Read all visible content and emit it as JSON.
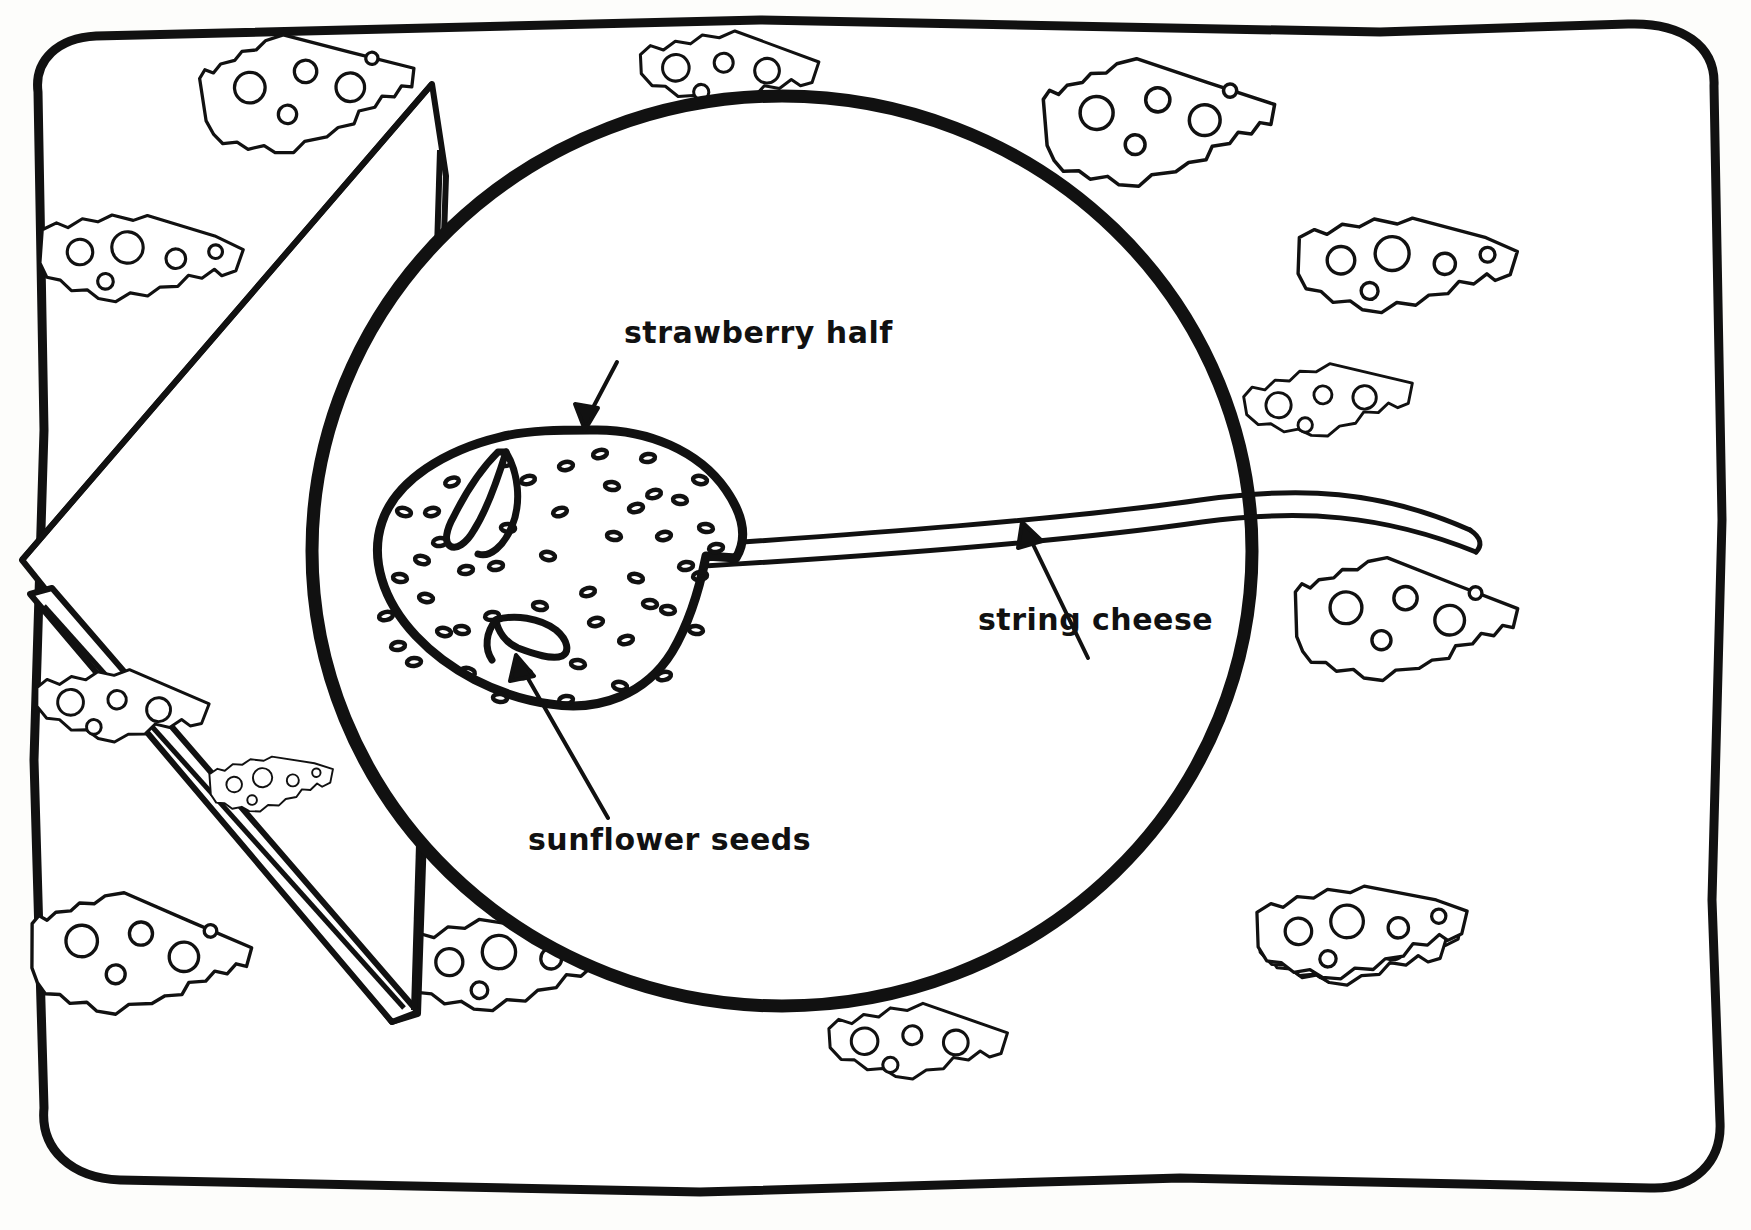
{
  "document": {
    "title": "Strawberry Mouse Snack",
    "style": "black-and-white hand-drawn line illustration",
    "background_color": "#fdfdfb",
    "ink_color": "#111111"
  },
  "labels": [
    {
      "id": "strawberry-half",
      "text": "strawberry half",
      "x": 624,
      "y": 318,
      "arrow": {
        "from_x": 617,
        "from_y": 362,
        "to_x": 585,
        "to_y": 430
      }
    },
    {
      "id": "string-cheese",
      "text": "string cheese",
      "x": 978,
      "y": 605,
      "arrow": {
        "from_x": 1090,
        "from_y": 660,
        "to_x": 1022,
        "to_y": 522
      }
    },
    {
      "id": "sunflower-seeds",
      "text": "sunflower seeds",
      "x": 528,
      "y": 825,
      "arrow": {
        "from_x": 608,
        "from_y": 818,
        "to_x": 516,
        "to_y": 655
      }
    }
  ],
  "scene": {
    "placemat": {
      "name": "cheese-print placemat",
      "outline": "hand-drawn rounded rectangle",
      "stroke_width": 9
    },
    "plate": {
      "name": "round plate",
      "center_x": 782,
      "center_y": 551,
      "radius_x": 470,
      "radius_y": 455,
      "stroke_width": 13
    },
    "napkin": {
      "name": "folded triangular napkin",
      "stroke_width": 6
    },
    "strawberry": {
      "name": "strawberry half shaped like a mouse body",
      "seed_dots": 96
    },
    "tail": {
      "name": "string cheese tail",
      "stroke_width": 5
    },
    "ears": [
      {
        "name": "sunflower seed ear upper"
      },
      {
        "name": "sunflower seed ear lower"
      }
    ],
    "cheese_pieces_count": 12
  }
}
